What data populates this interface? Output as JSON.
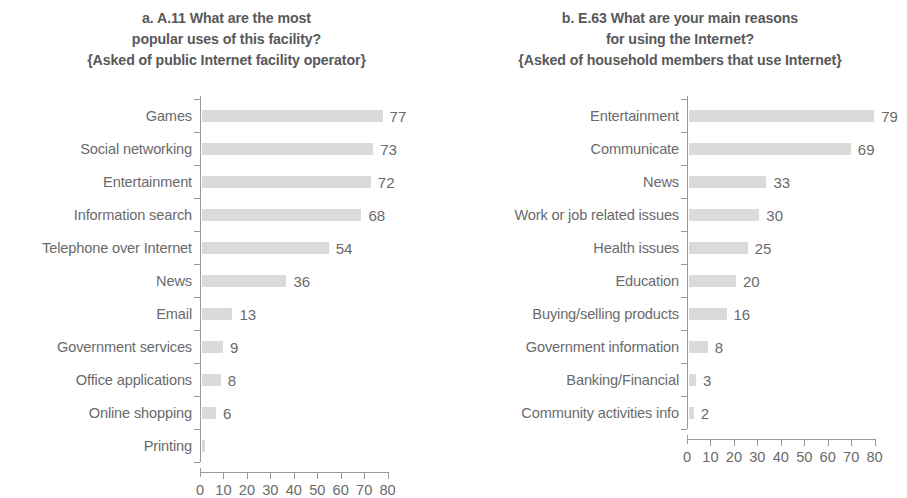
{
  "figure": {
    "background": "#ffffff",
    "bar_color": "#d6d6d6",
    "text_color": "#6a6a6c",
    "axis_color": "#9a9a9c"
  },
  "chart_data": [
    {
      "type": "bar",
      "orientation": "horizontal",
      "panel_label": "a.",
      "title": "a. A.11 What are the most popular uses of this facility? {Asked of public Internet facility operator}",
      "title_lines": [
        "a. A.11 What are the most",
        "popular uses of this facility?",
        "{Asked of public Internet facility operator}"
      ],
      "categories": [
        "Games",
        "Social networking",
        "Entertainment",
        "Information search",
        "Telephone over Internet",
        "News",
        "Email",
        "Government services",
        "Office applications",
        "Online shopping",
        "Printing"
      ],
      "values": [
        77,
        73,
        72,
        68,
        54,
        36,
        13,
        9,
        8,
        6,
        0
      ],
      "value_labels": [
        "77",
        "73",
        "72",
        "68",
        "54",
        "36",
        "13",
        "9",
        "8",
        "6",
        ""
      ],
      "xlabel": "",
      "ylabel": "",
      "xlim": [
        0,
        80
      ],
      "xticks": [
        0,
        10,
        20,
        30,
        40,
        50,
        60,
        70,
        80
      ],
      "xtick_labels": [
        "0",
        "10",
        "20",
        "30",
        "40",
        "50",
        "60",
        "70",
        "80"
      ],
      "grid": false,
      "legend": null
    },
    {
      "type": "bar",
      "orientation": "horizontal",
      "panel_label": "b.",
      "title": "b. E.63 What are your main reasons for using the Internet? {Asked of household members that use Internet}",
      "title_lines": [
        "b. E.63 What are your main reasons",
        "for using the Internet?",
        "{Asked of household members that use Internet}"
      ],
      "categories": [
        "Entertainment",
        "Communicate",
        "News",
        "Work or job related issues",
        "Health issues",
        "Education",
        "Buying/selling products",
        "Government information",
        "Banking/Financial",
        "Community activities info"
      ],
      "values": [
        79,
        69,
        33,
        30,
        25,
        20,
        16,
        8,
        3,
        2
      ],
      "value_labels": [
        "79",
        "69",
        "33",
        "30",
        "25",
        "20",
        "16",
        "8",
        "3",
        "2"
      ],
      "xlabel": "",
      "ylabel": "",
      "xlim": [
        0,
        80
      ],
      "xticks": [
        0,
        10,
        20,
        30,
        40,
        50,
        60,
        70,
        80
      ],
      "xtick_labels": [
        "0",
        "10",
        "20",
        "30",
        "40",
        "50",
        "60",
        "70",
        "80"
      ],
      "grid": false,
      "legend": null
    }
  ]
}
